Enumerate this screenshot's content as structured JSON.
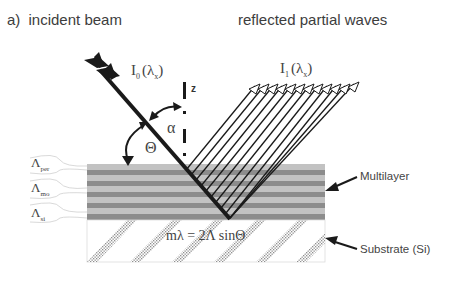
{
  "figure": {
    "panel_label": "a)",
    "title_left": "incident beam",
    "title_right": "reflected partial waves",
    "incident_intensity": {
      "symbol": "I",
      "sub": "0",
      "arg": "(λ",
      "arg_sub": "x",
      "arg_close": ")"
    },
    "reflected_intensity": {
      "symbol": "I",
      "sub": "1",
      "arg": "(λ",
      "arg_sub": "x",
      "arg_close": ")"
    },
    "axis_label": "z",
    "angle_alpha": "α",
    "angle_theta": "Θ",
    "bragg_equation": "mλ = 2Λ sinΘ",
    "layer_labels": [
      {
        "symbol": "Λ",
        "sub": "per"
      },
      {
        "symbol": "Λ",
        "sub": "mo"
      },
      {
        "symbol": "Λ",
        "sub": "si"
      }
    ],
    "callouts": {
      "multilayer": "Multilayer",
      "substrate": "Substrate (Si)"
    },
    "colors": {
      "light_layer": "#c2c2c2",
      "dark_layer": "#8c8c8c",
      "beam": "#1a1a1a",
      "substrate_hatch": "#9a9a9a"
    },
    "reflected_wave_count": 12
  }
}
